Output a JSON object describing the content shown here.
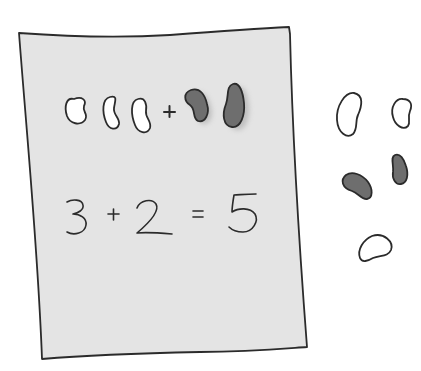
{
  "illustration": {
    "description": "Hand-drawn worksheet showing bean counting addition",
    "colors": {
      "paper": "#e4e4e4",
      "outline": "#2b2b2b",
      "white_bean": "#ffffff",
      "dark_bean": "#6e6e6e",
      "background": "#ffffff"
    },
    "worksheet": {
      "bean_row": {
        "white_beans": 3,
        "operator": "+",
        "dark_beans": 2
      },
      "equation": {
        "a": "3",
        "plus": "+",
        "b": "2",
        "equals": "=",
        "result": "5"
      }
    },
    "loose_beans": {
      "white_count": 3,
      "dark_count": 2
    }
  }
}
